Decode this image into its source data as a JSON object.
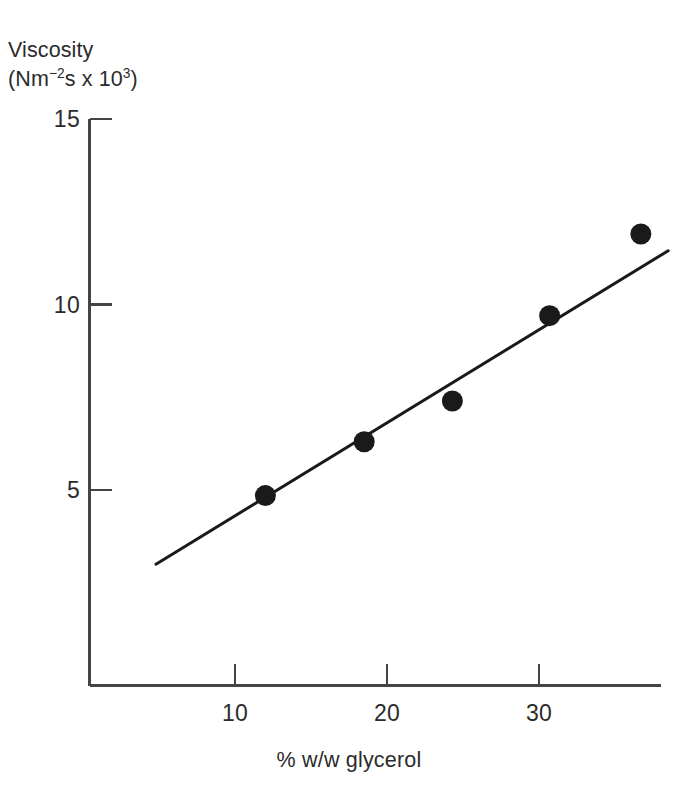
{
  "chart_data": {
    "type": "scatter",
    "title": "",
    "xlabel": "% w/w glycerol",
    "ylabel_line1": "Viscosity",
    "ylabel_line2_prefix": "(Nm",
    "ylabel_line2_sup1": "−2",
    "ylabel_line2_mid": "s x 10",
    "ylabel_line2_sup2": "3",
    "ylabel_line2_suffix": ")",
    "ylabel": "Viscosity (Nm−2s x 103)",
    "xlim": [
      4.1,
      41.5
    ],
    "ylim": [
      0.0,
      15.6
    ],
    "xticks": [
      10,
      20,
      30
    ],
    "xtick_labels": [
      "10",
      "20",
      "30"
    ],
    "yticks": [
      5,
      10,
      15
    ],
    "ytick_labels": [
      "5",
      "10",
      "15"
    ],
    "grid": false,
    "legend": "none",
    "tick_direction": "in",
    "marker": "filled-circle",
    "marker_color": "#1a1a1a",
    "line_color": "#1a1a1a",
    "axis_color": "#444444",
    "points": [
      {
        "x": 12.0,
        "y": 4.85
      },
      {
        "x": 18.5,
        "y": 6.3
      },
      {
        "x": 24.3,
        "y": 7.4
      },
      {
        "x": 30.7,
        "y": 9.7
      },
      {
        "x": 36.7,
        "y": 11.9
      }
    ],
    "series": [
      {
        "name": "viscosity vs glycerol",
        "x": [
          12.0,
          18.5,
          24.3,
          30.7,
          36.7
        ],
        "values": [
          4.85,
          6.3,
          7.4,
          9.7,
          11.9
        ]
      }
    ],
    "fit_line": {
      "type": "linear",
      "x_start": 4.8,
      "y_start": 3.0,
      "x_end": 38.5,
      "y_end": 11.45
    }
  }
}
